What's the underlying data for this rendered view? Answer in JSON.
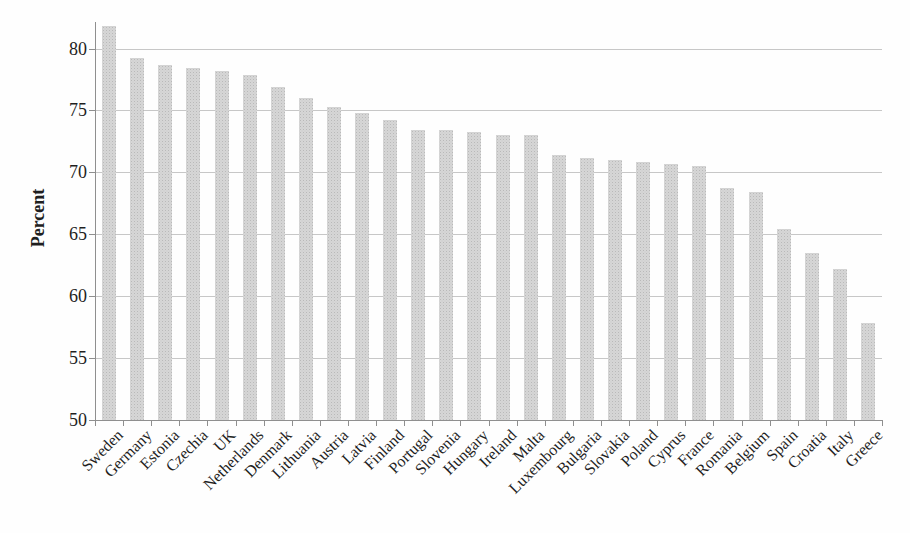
{
  "figure": {
    "ylabel": "Percent",
    "colors": {
      "background": "#fefefe",
      "bar_fill": "#d6d6d6",
      "bar_speckle": "#b9b9b9",
      "axis": "#8f8f8f",
      "grid": "#bdbdbd",
      "text": "#1f1f1f"
    }
  },
  "chart_data": {
    "type": "bar",
    "title": "",
    "xlabel": "",
    "ylabel": "Percent",
    "ylim": [
      50,
      82.5
    ],
    "yticks": [
      50,
      55,
      60,
      65,
      70,
      75,
      80
    ],
    "grid": true,
    "legend_position": "none",
    "bar_sort": "descending",
    "categories": [
      "Sweden",
      "Germany",
      "Estonia",
      "Czechia",
      "UK",
      "Netherlands",
      "Denmark",
      "Lithuania",
      "Austria",
      "Latvia",
      "Finland",
      "Portugal",
      "Slovenia",
      "Hungary",
      "Ireland",
      "Malta",
      "Luxembourg",
      "Bulgaria",
      "Slovakia",
      "Poland",
      "Cyprus",
      "France",
      "Romania",
      "Belgium",
      "Spain",
      "Croatia",
      "Italy",
      "Greece"
    ],
    "values": [
      81.8,
      79.2,
      78.7,
      78.4,
      78.2,
      77.9,
      76.9,
      76.0,
      75.3,
      74.8,
      74.2,
      73.4,
      73.4,
      73.3,
      73.0,
      73.0,
      71.4,
      71.2,
      71.0,
      70.8,
      70.7,
      70.5,
      68.7,
      68.4,
      65.4,
      63.5,
      62.2,
      57.8
    ]
  }
}
